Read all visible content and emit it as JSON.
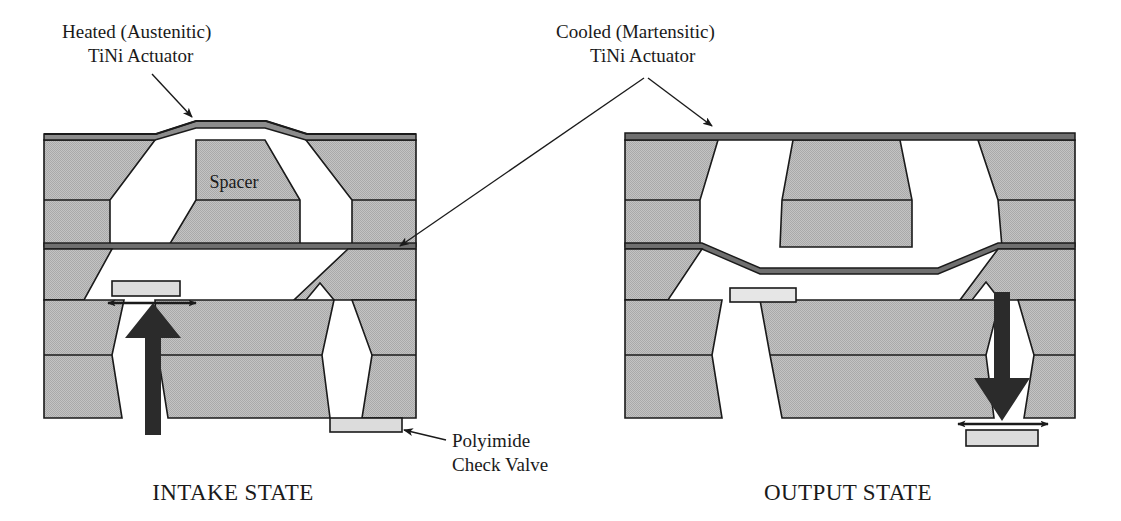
{
  "figure": {
    "type": "cross-section-diagram",
    "background_color": "#ffffff",
    "line_color": "#1a1a1a",
    "body_fill": "#b9b9b9",
    "membrane_fill": "#8c8c8c",
    "valve_fill": "#dcdcdc",
    "arrow_fill": "#2b2b2b"
  },
  "callouts": [
    {
      "id": "heated-actuator",
      "line1": "Heated (Austenitic)",
      "line2": "TiNi Actuator"
    },
    {
      "id": "cooled-actuator",
      "line1": "Cooled (Martensitic)",
      "line2": "TiNi Actuator"
    },
    {
      "id": "polyimide-check-valve",
      "line1": "Polyimide",
      "line2": "Check Valve"
    }
  ],
  "panels": [
    {
      "id": "intake",
      "state_label": "INTAKE STATE",
      "spacer_label": "Spacer",
      "membrane_top_state": "bulged-up",
      "membrane_bottom_state": "flat",
      "inlet_valve": "open",
      "outlet_valve": "closed",
      "flow_arrow_direction": "up"
    },
    {
      "id": "output",
      "state_label": "OUTPUT STATE",
      "spacer_label": "",
      "membrane_top_state": "flat",
      "membrane_bottom_state": "deflected-down",
      "inlet_valve": "closed",
      "outlet_valve": "open",
      "flow_arrow_direction": "down"
    }
  ]
}
